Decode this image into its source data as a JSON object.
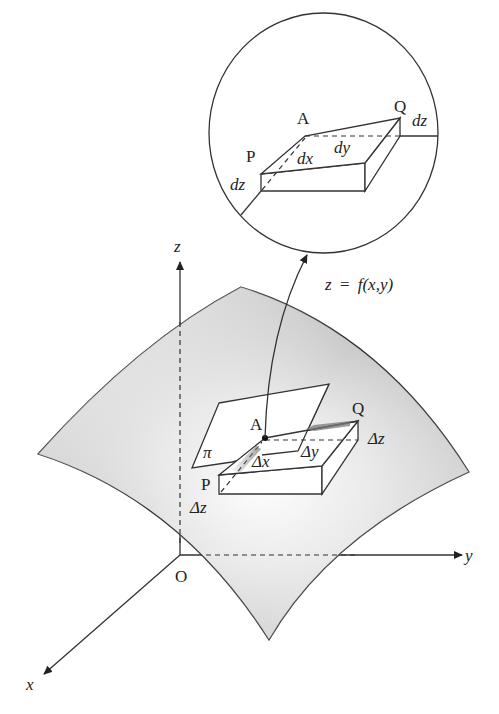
{
  "figure": {
    "type": "total differential geometric illustration",
    "surface_label": "z = f(x,y)",
    "colors": {
      "line": "#333333",
      "surface_dark": "#a9a9a9",
      "surface_light": "#ffffff",
      "arrow_gray": "#8c8c8c",
      "background": "#ffffff"
    }
  },
  "axes": {
    "origin_label": "O",
    "x_label": "x",
    "y_label": "y",
    "z_label": "z"
  },
  "main_box": {
    "point_a": "A",
    "point_p": "P",
    "point_q": "Q",
    "plane_label": "π",
    "delta_x": "Δx",
    "delta_y": "Δy",
    "delta_z_left": "Δz",
    "delta_z_right": "Δz"
  },
  "magnified_view": {
    "point_a": "A",
    "point_p": "P",
    "point_q": "Q",
    "dx": "dx",
    "dy": "dy",
    "dz_left": "dz",
    "dz_right": "dz"
  },
  "equation": {
    "lhs": "z",
    "eq": "=",
    "rhs": "f(x,y)"
  }
}
